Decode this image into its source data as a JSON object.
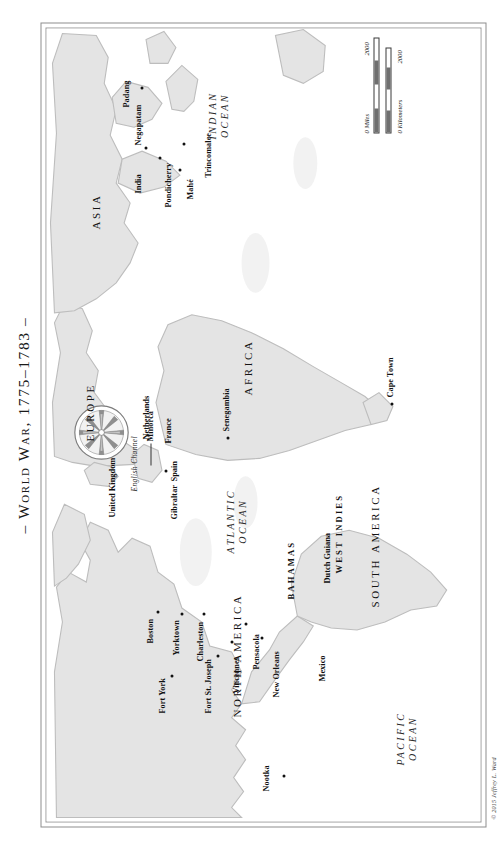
{
  "map": {
    "title": "– World War, 1775–1783 –",
    "credit": "© 2015 Jeffrey L. Ward",
    "continents": [
      {
        "name": "NORTH AMERICA"
      },
      {
        "name": "SOUTH AMERICA"
      },
      {
        "name": "EUROPE"
      },
      {
        "name": "AFRICA"
      },
      {
        "name": "ASIA"
      }
    ],
    "oceans": [
      {
        "name": "PACIFIC OCEAN"
      },
      {
        "name": "ATLANTIC OCEAN"
      },
      {
        "name": "INDIAN OCEAN"
      }
    ],
    "water_features": [
      {
        "name": "English Channel"
      }
    ],
    "regions": [
      {
        "name": "BAHAMAS"
      },
      {
        "name": "WEST INDIES"
      }
    ],
    "countries": [
      {
        "name": "United Kingdom"
      },
      {
        "name": "Netherlands"
      },
      {
        "name": "France"
      },
      {
        "name": "Spain"
      },
      {
        "name": "Mexico"
      },
      {
        "name": "Dutch Guiana"
      },
      {
        "name": "India"
      }
    ],
    "places": [
      {
        "name": "Nootka"
      },
      {
        "name": "Fort York"
      },
      {
        "name": "Fort St. Joseph"
      },
      {
        "name": "Vincennes"
      },
      {
        "name": "Boston"
      },
      {
        "name": "Yorktown"
      },
      {
        "name": "Charleston"
      },
      {
        "name": "Pensacola"
      },
      {
        "name": "New Orleans"
      },
      {
        "name": "Gibraltar"
      },
      {
        "name": "Minorca"
      },
      {
        "name": "Senegambia"
      },
      {
        "name": "Cape Town"
      },
      {
        "name": "Pondicherry"
      },
      {
        "name": "Negapatam"
      },
      {
        "name": "Mahé"
      },
      {
        "name": "Trincomalee"
      },
      {
        "name": "Padang"
      }
    ],
    "scale": {
      "miles_label": "0 Miles",
      "miles_max": "2000",
      "km_label": "0 Kilometers",
      "km_max": "2000"
    },
    "colors": {
      "land": "#e3e3e3",
      "land_stroke": "#b9b9b9",
      "ocean": "#ffffff",
      "text": "#111111",
      "frame": "#8d8d8d"
    }
  }
}
